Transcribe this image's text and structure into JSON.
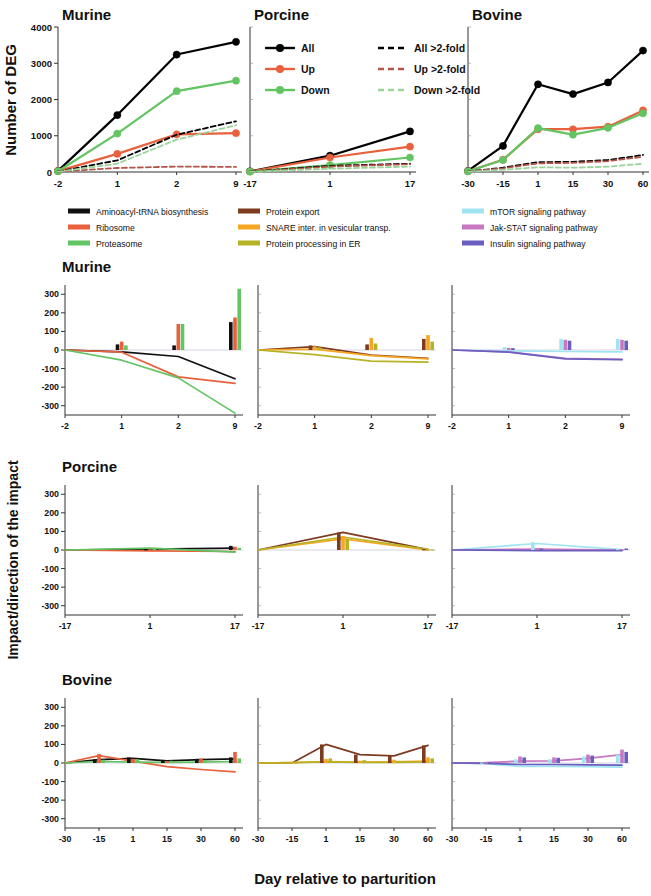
{
  "figure": {
    "xaxis_title": "Day relative to parturition",
    "top_ylabel": "Number of DEG",
    "bottom_ylabel": "Impact/direction of the impact"
  },
  "species": {
    "murine": "Murine",
    "porcine": "Porcine",
    "bovine": "Bovine"
  },
  "deg_legend": {
    "items": [
      {
        "label": "All",
        "color": "#000000",
        "style": "solid-marker"
      },
      {
        "label": "Up",
        "color": "#e8603c",
        "style": "solid-marker"
      },
      {
        "label": "Down",
        "color": "#62c462",
        "style": "solid-marker"
      },
      {
        "label": "All >2-fold",
        "color": "#000000",
        "style": "dashed"
      },
      {
        "label": "Up >2-fold",
        "color": "#b5554a",
        "style": "dashed"
      },
      {
        "label": "Down >2-fold",
        "color": "#9ad49a",
        "style": "dashed"
      }
    ]
  },
  "pathway_legend": {
    "columns": [
      [
        {
          "label": "Aminoacyl-tRNA biosynthesis",
          "color": "#111111"
        },
        {
          "label": "Ribosome",
          "color": "#e8603c"
        },
        {
          "label": "Proteasome",
          "color": "#62c462"
        }
      ],
      [
        {
          "label": "Protein export",
          "color": "#7d3b20"
        },
        {
          "label": "SNARE inter. in vesicular transp.",
          "color": "#f5a623"
        },
        {
          "label": "Protein processing in ER",
          "color": "#b5b324"
        }
      ],
      [
        {
          "label": "mTOR signaling pathway",
          "color": "#9fe4f0"
        },
        {
          "label": "Jak-STAT signaling pathway",
          "color": "#c878c0"
        },
        {
          "label": "Insulin signaling pathway",
          "color": "#6a5fc0"
        }
      ]
    ]
  },
  "chart_data": [
    {
      "id": "deg-murine",
      "type": "line",
      "title": "Murine",
      "xlabel": "Day relative to parturition",
      "ylabel": "Number of DEG",
      "ylim": [
        0,
        4000
      ],
      "yticks": [
        0,
        1000,
        2000,
        3000,
        4000
      ],
      "categories": [
        "-2",
        "1",
        "2",
        "9"
      ],
      "xticklabels": [
        "-2",
        "1",
        "2",
        "9"
      ],
      "grid": false,
      "series": [
        {
          "name": "All",
          "color": "#000000",
          "dash": false,
          "markers": true,
          "values": [
            30,
            1570,
            3240,
            3590
          ]
        },
        {
          "name": "Up",
          "color": "#e8603c",
          "dash": false,
          "markers": true,
          "values": [
            25,
            500,
            1040,
            1070
          ]
        },
        {
          "name": "Down",
          "color": "#62c462",
          "dash": false,
          "markers": true,
          "values": [
            20,
            1060,
            2230,
            2520
          ]
        },
        {
          "name": "All >2-fold",
          "color": "#000000",
          "dash": true,
          "markers": false,
          "values": [
            15,
            320,
            1030,
            1400
          ]
        },
        {
          "name": "Up >2-fold",
          "color": "#b5554a",
          "dash": true,
          "markers": false,
          "values": [
            10,
            110,
            150,
            140
          ]
        },
        {
          "name": "Down >2-fold",
          "color": "#9ad49a",
          "dash": true,
          "markers": false,
          "values": [
            8,
            230,
            890,
            1290
          ]
        }
      ]
    },
    {
      "id": "deg-porcine",
      "type": "line",
      "title": "Porcine",
      "ylim": [
        0,
        4000
      ],
      "categories": [
        "-17",
        "1",
        "17"
      ],
      "xticklabels": [
        "-17",
        "1",
        "17"
      ],
      "grid": false,
      "series": [
        {
          "name": "All",
          "color": "#000000",
          "dash": false,
          "markers": true,
          "values": [
            20,
            450,
            1120
          ]
        },
        {
          "name": "Up",
          "color": "#e8603c",
          "dash": false,
          "markers": true,
          "values": [
            15,
            400,
            700
          ]
        },
        {
          "name": "Down",
          "color": "#62c462",
          "dash": false,
          "markers": true,
          "values": [
            10,
            190,
            400
          ]
        },
        {
          "name": "All >2-fold",
          "color": "#000000",
          "dash": true,
          "markers": false,
          "values": [
            10,
            170,
            230
          ]
        },
        {
          "name": "Up >2-fold",
          "color": "#b5554a",
          "dash": true,
          "markers": false,
          "values": [
            8,
            150,
            215
          ]
        },
        {
          "name": "Down >2-fold",
          "color": "#9ad49a",
          "dash": true,
          "markers": false,
          "values": [
            5,
            90,
            150
          ]
        }
      ]
    },
    {
      "id": "deg-bovine",
      "type": "line",
      "title": "Bovine",
      "ylim": [
        0,
        4000
      ],
      "categories": [
        "-30",
        "-15",
        "1",
        "15",
        "30",
        "60"
      ],
      "xticklabels": [
        "-30",
        "-15",
        "1",
        "15",
        "30",
        "60"
      ],
      "grid": false,
      "series": [
        {
          "name": "All",
          "color": "#000000",
          "dash": false,
          "markers": true,
          "values": [
            30,
            720,
            2420,
            2150,
            2470,
            3350
          ]
        },
        {
          "name": "Up",
          "color": "#e8603c",
          "dash": false,
          "markers": true,
          "values": [
            20,
            340,
            1180,
            1180,
            1250,
            1700
          ]
        },
        {
          "name": "Down",
          "color": "#62c462",
          "dash": false,
          "markers": true,
          "values": [
            18,
            330,
            1210,
            1030,
            1220,
            1620
          ]
        },
        {
          "name": "All >2-fold",
          "color": "#000000",
          "dash": true,
          "markers": false,
          "values": [
            10,
            120,
            270,
            280,
            330,
            470
          ]
        },
        {
          "name": "Up >2-fold",
          "color": "#b5554a",
          "dash": true,
          "markers": false,
          "values": [
            8,
            100,
            240,
            250,
            300,
            420
          ]
        },
        {
          "name": "Down >2-fold",
          "color": "#9ad49a",
          "dash": true,
          "markers": false,
          "values": [
            5,
            60,
            130,
            120,
            150,
            230
          ]
        }
      ]
    },
    {
      "id": "impact-murine-translation",
      "type": "bar-line",
      "row": "Murine",
      "column": 1,
      "ylabel": "Impact/direction of the impact",
      "ylim": [
        -350,
        350
      ],
      "yticks": [
        -300,
        -200,
        -100,
        0,
        100,
        200,
        300
      ],
      "categories": [
        "-2",
        "1",
        "2",
        "9"
      ],
      "xticklabels": [
        "-2",
        "1",
        "2",
        "9"
      ],
      "series": [
        {
          "name": "Aminoacyl-tRNA biosynthesis",
          "color": "#111111",
          "bars": [
            0,
            30,
            25,
            150
          ],
          "line": [
            0,
            -10,
            -35,
            -155
          ]
        },
        {
          "name": "Ribosome",
          "color": "#e8603c",
          "bars": [
            0,
            45,
            140,
            175
          ],
          "line": [
            0,
            -12,
            -145,
            -180
          ]
        },
        {
          "name": "Proteasome",
          "color": "#62c462",
          "bars": [
            0,
            25,
            140,
            330
          ],
          "line": [
            0,
            -55,
            -150,
            -340
          ]
        }
      ]
    },
    {
      "id": "impact-murine-transport",
      "type": "bar-line",
      "row": "Murine",
      "column": 2,
      "ylim": [
        -350,
        350
      ],
      "categories": [
        "-2",
        "1",
        "2",
        "9"
      ],
      "xticklabels": [
        "-2",
        "1",
        "2",
        "9"
      ],
      "series": [
        {
          "name": "Protein export",
          "color": "#7d3b20",
          "bars": [
            0,
            25,
            30,
            60
          ],
          "line": [
            0,
            18,
            -28,
            -45
          ]
        },
        {
          "name": "SNARE inter. in vesicular transp.",
          "color": "#f5a623",
          "bars": [
            0,
            20,
            65,
            80
          ],
          "line": [
            0,
            5,
            -30,
            -48
          ]
        },
        {
          "name": "Protein processing in ER",
          "color": "#b5b324",
          "bars": [
            0,
            15,
            35,
            45
          ],
          "line": [
            0,
            -25,
            -60,
            -65
          ]
        }
      ]
    },
    {
      "id": "impact-murine-signaling",
      "type": "bar-line",
      "row": "Murine",
      "column": 3,
      "ylim": [
        -350,
        350
      ],
      "categories": [
        "-2",
        "1",
        "2",
        "9"
      ],
      "xticklabels": [
        "-2",
        "1",
        "2",
        "9"
      ],
      "series": [
        {
          "name": "mTOR signaling pathway",
          "color": "#9fe4f0",
          "bars": [
            0,
            15,
            60,
            60
          ],
          "line": [
            0,
            -5,
            -8,
            -10
          ]
        },
        {
          "name": "Jak-STAT signaling pathway",
          "color": "#c878c0",
          "bars": [
            0,
            12,
            55,
            55
          ],
          "line": [
            0,
            -10,
            -45,
            -50
          ]
        },
        {
          "name": "Insulin signaling pathway",
          "color": "#6a5fc0",
          "bars": [
            0,
            10,
            50,
            50
          ],
          "line": [
            0,
            -12,
            -48,
            -52
          ]
        }
      ]
    },
    {
      "id": "impact-porcine-translation",
      "type": "bar-line",
      "row": "Porcine",
      "column": 1,
      "ylim": [
        -350,
        350
      ],
      "categories": [
        "-17",
        "1",
        "17"
      ],
      "xticklabels": [
        "-17",
        "1",
        "17"
      ],
      "series": [
        {
          "name": "Aminoacyl-tRNA biosynthesis",
          "color": "#111111",
          "bars": [
            0,
            5,
            22
          ],
          "line": [
            0,
            5,
            10
          ]
        },
        {
          "name": "Ribosome",
          "color": "#e8603c",
          "bars": [
            0,
            4,
            18
          ],
          "line": [
            0,
            -5,
            -8
          ]
        },
        {
          "name": "Proteasome",
          "color": "#62c462",
          "bars": [
            0,
            8,
            12
          ],
          "line": [
            0,
            10,
            -12
          ]
        }
      ]
    },
    {
      "id": "impact-porcine-transport",
      "type": "bar-line",
      "row": "Porcine",
      "column": 2,
      "ylim": [
        -350,
        350
      ],
      "categories": [
        "-17",
        "1",
        "17"
      ],
      "xticklabels": [
        "-17",
        "1",
        "17"
      ],
      "series": [
        {
          "name": "Protein export",
          "color": "#7d3b20",
          "bars": [
            0,
            95,
            5
          ],
          "line": [
            0,
            95,
            2
          ]
        },
        {
          "name": "SNARE inter. in vesicular transp.",
          "color": "#f5a623",
          "bars": [
            0,
            75,
            4
          ],
          "line": [
            0,
            60,
            0
          ]
        },
        {
          "name": "Protein processing in ER",
          "color": "#b5b324",
          "bars": [
            0,
            60,
            3
          ],
          "line": [
            0,
            70,
            3
          ]
        }
      ]
    },
    {
      "id": "impact-porcine-signaling",
      "type": "bar-line",
      "row": "Porcine",
      "column": 3,
      "ylim": [
        -350,
        350
      ],
      "categories": [
        "-17",
        "1",
        "17"
      ],
      "xticklabels": [
        "-17",
        "1",
        "17"
      ],
      "series": [
        {
          "name": "mTOR signaling pathway",
          "color": "#9fe4f0",
          "bars": [
            0,
            42,
            6
          ],
          "line": [
            0,
            35,
            2
          ]
        },
        {
          "name": "Jak-STAT signaling pathway",
          "color": "#c878c0",
          "bars": [
            0,
            10,
            5
          ],
          "line": [
            0,
            5,
            0
          ]
        },
        {
          "name": "Insulin signaling pathway",
          "color": "#6a5fc0",
          "bars": [
            0,
            8,
            8
          ],
          "line": [
            0,
            -3,
            -4
          ]
        }
      ]
    },
    {
      "id": "impact-bovine-translation",
      "type": "bar-line",
      "row": "Bovine",
      "column": 1,
      "ylim": [
        -350,
        350
      ],
      "categories": [
        "-30",
        "-15",
        "1",
        "15",
        "30",
        "60"
      ],
      "xticklabels": [
        "-30",
        "-15",
        "1",
        "15",
        "30",
        "60"
      ],
      "series": [
        {
          "name": "Aminoacyl-tRNA biosynthesis",
          "color": "#111111",
          "bars": [
            0,
            20,
            30,
            15,
            22,
            30
          ],
          "line": [
            0,
            18,
            25,
            12,
            18,
            22
          ]
        },
        {
          "name": "Ribosome",
          "color": "#e8603c",
          "bars": [
            0,
            48,
            22,
            10,
            25,
            60
          ],
          "line": [
            0,
            40,
            10,
            -20,
            -35,
            -48
          ]
        },
        {
          "name": "Proteasome",
          "color": "#62c462",
          "bars": [
            0,
            18,
            20,
            12,
            15,
            25
          ],
          "line": [
            0,
            8,
            5,
            3,
            5,
            8
          ]
        }
      ]
    },
    {
      "id": "impact-bovine-transport",
      "type": "bar-line",
      "row": "Bovine",
      "column": 2,
      "ylim": [
        -350,
        350
      ],
      "categories": [
        "-30",
        "-15",
        "1",
        "15",
        "30",
        "60"
      ],
      "xticklabels": [
        "-30",
        "-15",
        "1",
        "15",
        "30",
        "60"
      ],
      "series": [
        {
          "name": "Protein export",
          "color": "#7d3b20",
          "bars": [
            0,
            0,
            100,
            45,
            38,
            95
          ],
          "line": [
            0,
            0,
            100,
            45,
            38,
            95
          ]
        },
        {
          "name": "SNARE inter. in vesicular transp.",
          "color": "#f5a623",
          "bars": [
            0,
            4,
            22,
            12,
            18,
            30
          ],
          "line": [
            0,
            2,
            8,
            5,
            6,
            10
          ]
        },
        {
          "name": "Protein processing in ER",
          "color": "#b5b324",
          "bars": [
            0,
            4,
            25,
            15,
            12,
            25
          ],
          "line": [
            0,
            2,
            6,
            4,
            4,
            6
          ]
        }
      ]
    },
    {
      "id": "impact-bovine-signaling",
      "type": "bar-line",
      "row": "Bovine",
      "column": 3,
      "ylim": [
        -350,
        350
      ],
      "categories": [
        "-30",
        "-15",
        "1",
        "15",
        "30",
        "60"
      ],
      "xticklabels": [
        "-30",
        "-15",
        "1",
        "15",
        "30",
        "60"
      ],
      "series": [
        {
          "name": "mTOR signaling pathway",
          "color": "#9fe4f0",
          "bars": [
            0,
            2,
            20,
            20,
            35,
            45
          ],
          "line": [
            0,
            -4,
            -18,
            -18,
            -20,
            -22
          ]
        },
        {
          "name": "Jak-STAT signaling pathway",
          "color": "#c878c0",
          "bars": [
            0,
            3,
            35,
            30,
            45,
            72
          ],
          "line": [
            0,
            2,
            10,
            12,
            25,
            45
          ]
        },
        {
          "name": "Insulin signaling pathway",
          "color": "#6a5fc0",
          "bars": [
            0,
            3,
            30,
            28,
            40,
            60
          ],
          "line": [
            0,
            -2,
            -8,
            -8,
            -10,
            -12
          ]
        }
      ]
    }
  ]
}
